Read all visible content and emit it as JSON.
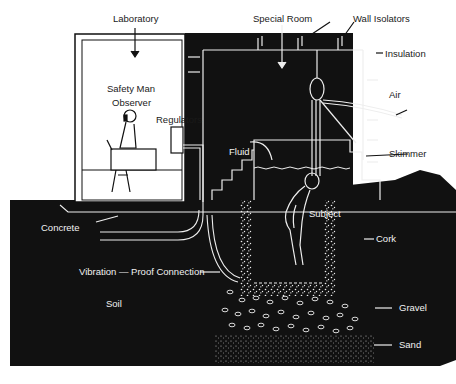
{
  "diagram": {
    "type": "cross-section",
    "colors": {
      "background": "#ffffff",
      "ink": "#111111",
      "line": "#f2f2f2"
    },
    "labels": {
      "laboratory": "Laboratory",
      "special_room": "Special Room",
      "wall_isolators": "Wall Isolators",
      "insulation": "Insulation",
      "air": "Air",
      "safety_man": "Safety Man",
      "observer": "Observer",
      "regulators": "Regulators",
      "fluid": "Fluid",
      "skimmer": "Skimmer",
      "subject": "Subject",
      "cork": "Cork",
      "concrete": "Concrete",
      "vibration_proof_connection": "Vibration — Proof Connection",
      "soil": "Soil",
      "gravel": "Gravel",
      "sand": "Sand"
    }
  }
}
